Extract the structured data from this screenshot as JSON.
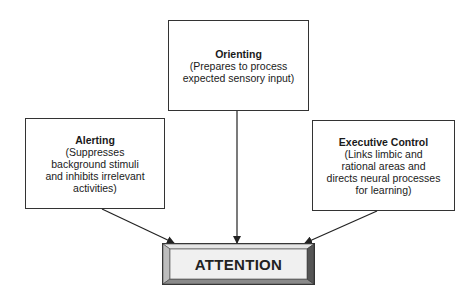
{
  "diagram": {
    "orienting": {
      "title": "Orienting",
      "lines": [
        "(Prepares to process",
        "expected sensory input)"
      ]
    },
    "alerting": {
      "title": "Alerting",
      "lines": [
        "(Suppresses",
        "background stimuli",
        "and inhibits irrelevant",
        "activities)"
      ]
    },
    "executive": {
      "title": "Executive Control",
      "lines": [
        "(Links limbic and",
        "rational areas and",
        "directs neural processes",
        "for learning)"
      ]
    },
    "attention": {
      "label": "ATTENTION"
    },
    "edges": [
      {
        "from": "alerting",
        "to": "attention"
      },
      {
        "from": "orienting",
        "to": "attention"
      },
      {
        "from": "executive",
        "to": "attention"
      }
    ],
    "colors": {
      "stroke": "#333333",
      "bevel_light": "#e6e6e6",
      "bevel_dark": "#555555",
      "face": "#f2f2f2"
    }
  }
}
